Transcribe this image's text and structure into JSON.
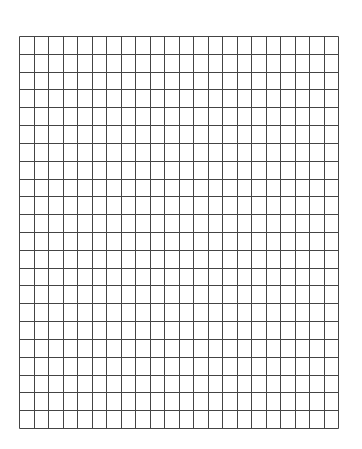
{
  "document": {
    "type": "graph-paper",
    "grid": {
      "columns": 22,
      "rows": 22,
      "line_color": "#444444",
      "background": "#ffffff"
    }
  }
}
